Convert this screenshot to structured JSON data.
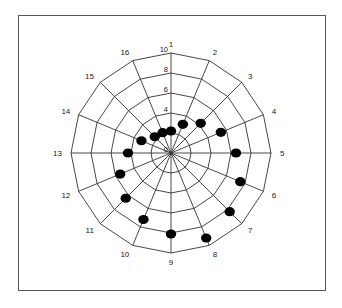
{
  "chart_data": {
    "type": "radar",
    "title": "",
    "categories": [
      "1",
      "2",
      "3",
      "4",
      "5",
      "6",
      "7",
      "8",
      "9",
      "10",
      "11",
      "12",
      "13",
      "14",
      "15",
      "16"
    ],
    "series": [
      {
        "name": "series-1",
        "marker": "filled-circle",
        "line": false,
        "values": [
          2.2,
          3.1,
          4.2,
          5.4,
          6.5,
          7.5,
          8.3,
          9.2,
          8.1,
          7.2,
          6.4,
          5.5,
          4.3,
          3.2,
          2.3,
          2.2
        ]
      }
    ],
    "radial_ticks": [
      "0",
      "4",
      "6",
      "8",
      "10"
    ],
    "radial_tick_values": [
      0,
      2,
      4,
      6,
      8,
      10
    ],
    "rlim": [
      0,
      10
    ],
    "grid": true,
    "legend": false
  },
  "colors": {
    "grid": "#333333",
    "marker": "#000000",
    "frame": "#555555"
  }
}
